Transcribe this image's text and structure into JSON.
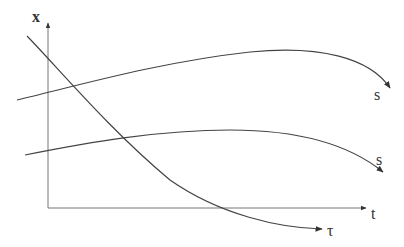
{
  "diagram": {
    "axes": {
      "y_label": "x",
      "x_label": "t"
    },
    "curves": [
      {
        "id": "upper",
        "label": "s"
      },
      {
        "id": "lower",
        "label": "s"
      },
      {
        "id": "decay",
        "label": "τ"
      }
    ],
    "colors": {
      "stroke": "#444444",
      "axis": "#777777",
      "text": "#333333"
    }
  }
}
